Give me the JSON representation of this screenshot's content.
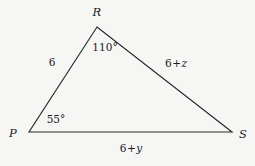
{
  "figure": {
    "kind": "triangle-diagram",
    "background_color": "#f6f6f5",
    "stroke_color": "#2b2b2b",
    "text_color": "#1b1b1b",
    "width": 255,
    "height": 166
  },
  "vertices": [
    {
      "name": "R",
      "label": "R",
      "x": 97,
      "y": 27,
      "label_x": 97,
      "label_y": 13
    },
    {
      "name": "P",
      "label": "P",
      "x": 29,
      "y": 132,
      "label_x": 13,
      "label_y": 134
    },
    {
      "name": "S",
      "label": "S",
      "x": 232,
      "y": 132,
      "label_x": 243,
      "label_y": 135
    }
  ],
  "angles": [
    {
      "at": "R",
      "label": "110°",
      "value": 110,
      "unit": "degrees",
      "x": 105,
      "y": 47
    },
    {
      "at": "P",
      "label": "55°",
      "value": 55,
      "unit": "degrees",
      "x": 56,
      "y": 119
    }
  ],
  "sides": [
    {
      "name": "PR",
      "from": "P",
      "to": "R",
      "label": "6",
      "prefix": "6",
      "operator": "",
      "variable": "",
      "x": 52,
      "y": 62
    },
    {
      "name": "RS",
      "from": "R",
      "to": "S",
      "label": "6 + z",
      "prefix": "6",
      "operator": "+",
      "variable": "z",
      "x": 176,
      "y": 63
    },
    {
      "name": "PS",
      "from": "P",
      "to": "S",
      "label": "6 + y",
      "prefix": "6",
      "operator": "+",
      "variable": "y",
      "x": 131,
      "y": 148
    }
  ]
}
